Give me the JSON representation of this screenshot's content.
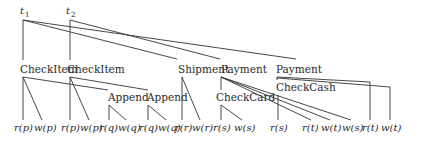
{
  "diagram": {
    "type": "transaction-tree",
    "roots": [
      {
        "id": "t1",
        "label": "t",
        "sub": "1",
        "x": 24,
        "y": 14
      },
      {
        "id": "t2",
        "label": "t",
        "sub": "2",
        "x": 70,
        "y": 14
      }
    ],
    "nodes": [
      {
        "id": "ci1",
        "label": "CheckItem",
        "x": 22,
        "y": 69
      },
      {
        "id": "ci2",
        "label": "CheckItem",
        "x": 68,
        "y": 69
      },
      {
        "id": "ship",
        "label": "Shipment",
        "x": 176,
        "y": 69
      },
      {
        "id": "pay1",
        "label": "Payment",
        "x": 219,
        "y": 69
      },
      {
        "id": "pay2",
        "label": "Payment",
        "x": 298,
        "y": 69
      },
      {
        "id": "app1",
        "label": "Append",
        "x": 108,
        "y": 99
      },
      {
        "id": "app2",
        "label": "Append",
        "x": 147,
        "y": 99
      },
      {
        "id": "card",
        "label": "CheckCard",
        "x": 219,
        "y": 99
      },
      {
        "id": "cash",
        "label": "CheckCash",
        "x": 276,
        "y": 89
      }
    ],
    "leaves": [
      {
        "label": "r(p)",
        "x": 24
      },
      {
        "label": "w(p)",
        "x": 42
      },
      {
        "label": "r(p)",
        "x": 70
      },
      {
        "label": "w(p)",
        "x": 88
      },
      {
        "label": "r(q)",
        "x": 108
      },
      {
        "label": "w(q)",
        "x": 126
      },
      {
        "label": "r(q)",
        "x": 148
      },
      {
        "label": "w(q)",
        "x": 166
      },
      {
        "label": "r(r)",
        "x": 183
      },
      {
        "label": "w(r)",
        "x": 201
      },
      {
        "label": "r(s)",
        "x": 221
      },
      {
        "label": "w(s)",
        "x": 242
      },
      {
        "label": "r(s)",
        "x": 278
      },
      {
        "label": "r(t)",
        "x": 308
      },
      {
        "label": "w(t)",
        "x": 329
      },
      {
        "label": "w(s)",
        "x": 350
      },
      {
        "label": "r(t)",
        "x": 369
      },
      {
        "label": "w(t)",
        "x": 390
      }
    ],
    "leaf_y": 131
  }
}
